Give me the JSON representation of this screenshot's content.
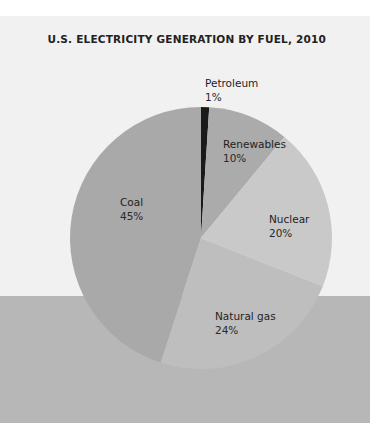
{
  "chart_data": {
    "type": "pie",
    "title": "U.S. ELECTRICITY GENERATION BY FUEL, 2010",
    "start_angle_deg": 0,
    "direction": "clockwise",
    "slices": [
      {
        "label": "Petroleum",
        "value": 1,
        "display": "1%",
        "color": "#1a1a1a"
      },
      {
        "label": "Renewables",
        "value": 10,
        "display": "10%",
        "color": "#ababab"
      },
      {
        "label": "Nuclear",
        "value": 20,
        "display": "20%",
        "color": "#c9c9c9"
      },
      {
        "label": "Natural gas",
        "value": 24,
        "display": "24%",
        "color": "#bebebe"
      },
      {
        "label": "Coal",
        "value": 45,
        "display": "45%",
        "color": "#a9a9a9"
      }
    ],
    "center": [
      201,
      238
    ],
    "radius": 131
  },
  "colors": {
    "panel": "#f1f1f1",
    "band": "#b7b7b7",
    "title": "#222222"
  }
}
